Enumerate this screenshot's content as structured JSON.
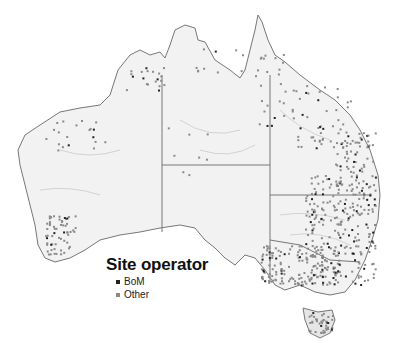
{
  "map": {
    "region": "Australia",
    "land_color": "#f2f2f2",
    "border_color": "#888888",
    "river_color": "#bfbfbf",
    "states": [
      "Western Australia",
      "Northern Territory",
      "South Australia",
      "Queensland",
      "New South Wales",
      "Victoria",
      "Tasmania"
    ]
  },
  "legend": {
    "title": "Site operator",
    "items": [
      {
        "label": "BoM",
        "color": "#222222"
      },
      {
        "label": "Other",
        "color": "#8a8a8a"
      }
    ]
  }
}
